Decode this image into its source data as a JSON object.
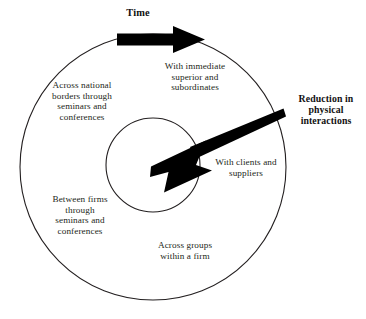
{
  "diagram": {
    "background_color": "#ffffff",
    "stroke_color": "#231f20",
    "arrow_color": "#000000",
    "text_color": "#231f20",
    "labels": {
      "time": "Time",
      "reduction": "Reduction in\nphysical\ninteractions",
      "immediate_superior": "With immediate\nsuperior and\nsubordinates",
      "clients_suppliers": "With clients and\nsuppliers",
      "across_groups": "Across groups\nwithin a firm",
      "across_national": "Across national\nborders through\nseminars and\nconferences",
      "between_firms": "Between firms\nthrough\nseminars and\nconferences"
    },
    "shapes": {
      "outer_circle": {
        "cx": 153,
        "cy": 167,
        "r": 133
      },
      "inner_circle": {
        "cx": 153,
        "cy": 165,
        "r": 47
      },
      "time_arrow": {
        "from_x": 117,
        "from_y": 39,
        "to_x": 205,
        "to_y": 39
      },
      "reduction_arrow": {
        "from_x": 284,
        "from_y": 112,
        "to_x": 151,
        "to_y": 167
      }
    }
  }
}
